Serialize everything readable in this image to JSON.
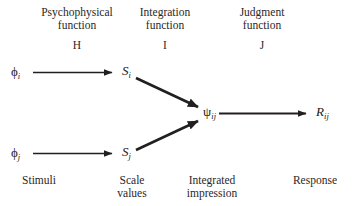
{
  "figure": {
    "background_color": "#ffffff",
    "ink_color": "#221f1f",
    "columns": [
      {
        "id": "psychophysical",
        "title": "Psychophysical\nfunction",
        "letter": "H"
      },
      {
        "id": "integration",
        "title": "Integration\nfunction",
        "letter": "I"
      },
      {
        "id": "judgment",
        "title": "Judgment\nfunction",
        "letter": "J"
      }
    ],
    "nodes": [
      {
        "id": "phi-i",
        "base": "ϕ",
        "sub": "i",
        "style": "upright"
      },
      {
        "id": "phi-j",
        "base": "ϕ",
        "sub": "j",
        "style": "upright"
      },
      {
        "id": "s-i",
        "base": "S",
        "sub": "i",
        "style": "italic"
      },
      {
        "id": "s-j",
        "base": "S",
        "sub": "j",
        "style": "italic"
      },
      {
        "id": "psi-ij",
        "base": "ψ",
        "sub": "ij",
        "style": "upright"
      },
      {
        "id": "r-ij",
        "base": "R",
        "sub": "ij",
        "style": "italic"
      }
    ],
    "stage_labels": [
      {
        "id": "stimuli",
        "text": "Stimuli"
      },
      {
        "id": "scale-values",
        "text": "Scale\nvalues"
      },
      {
        "id": "integrated-impression",
        "text": "Integrated\nimpression"
      },
      {
        "id": "response",
        "text": "Response"
      }
    ],
    "edges": [
      {
        "id": "phi-i-to-s-i",
        "from": "phi-i",
        "to": "s-i"
      },
      {
        "id": "phi-j-to-s-j",
        "from": "phi-j",
        "to": "s-j"
      },
      {
        "id": "s-i-to-psi-ij",
        "from": "s-i",
        "to": "psi-ij"
      },
      {
        "id": "s-j-to-psi-ij",
        "from": "s-j",
        "to": "psi-ij"
      },
      {
        "id": "psi-ij-to-r-ij",
        "from": "psi-ij",
        "to": "r-ij"
      }
    ]
  }
}
